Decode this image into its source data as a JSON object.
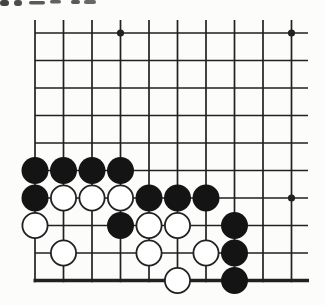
{
  "page": {
    "background_color": "#fcfcfa",
    "description_label": "go-corner-problem-diagram",
    "cropped_text_fragments": [
      {
        "x": 0,
        "y": 0,
        "w": 9,
        "h": 6,
        "opacity": 0.9
      },
      {
        "x": 14,
        "y": 0,
        "w": 8,
        "h": 6,
        "opacity": 0.85
      },
      {
        "x": 29,
        "y": 1,
        "w": 16,
        "h": 3.6,
        "opacity": 0.8
      },
      {
        "x": 50,
        "y": 0,
        "w": 11,
        "h": 3.6,
        "opacity": 0.75
      },
      {
        "x": 71,
        "y": 0,
        "w": 9,
        "h": 4,
        "opacity": 0.8
      },
      {
        "x": 84,
        "y": 0,
        "w": 12,
        "h": 4,
        "opacity": 0.72
      }
    ]
  },
  "board": {
    "line_color": "#212121",
    "colors": {
      "black_stone": "#141414",
      "white_stone": "#ffffff",
      "board_background": "#fcfcfa"
    },
    "grid": {
      "cols": 10,
      "rows": 10,
      "origin_x": 35,
      "origin_y": 33,
      "col_spacing": 28.5,
      "row_spacing": 27.5,
      "top_overflow_y": 20,
      "right_overflow_x": 308,
      "line_width": 1.7,
      "edge_line_width": 3.4
    },
    "star_points": [
      [
        4,
        1
      ],
      [
        10,
        1
      ],
      [
        10,
        7
      ]
    ],
    "star_radius": 3.6,
    "stone_radius": 13.5,
    "white_stone_stroke_width": 1.8,
    "stones": {
      "black": [
        [
          1,
          6
        ],
        [
          2,
          6
        ],
        [
          3,
          6
        ],
        [
          4,
          6
        ],
        [
          1,
          7
        ],
        [
          5,
          7
        ],
        [
          6,
          7
        ],
        [
          7,
          7
        ],
        [
          4,
          8
        ],
        [
          8,
          8
        ],
        [
          8,
          9
        ],
        [
          8,
          10
        ]
      ],
      "white": [
        [
          2,
          7
        ],
        [
          3,
          7
        ],
        [
          4,
          7
        ],
        [
          1,
          8
        ],
        [
          5,
          8
        ],
        [
          6,
          8
        ],
        [
          2,
          9
        ],
        [
          5,
          9
        ],
        [
          7,
          9
        ],
        [
          6,
          10
        ]
      ]
    }
  }
}
